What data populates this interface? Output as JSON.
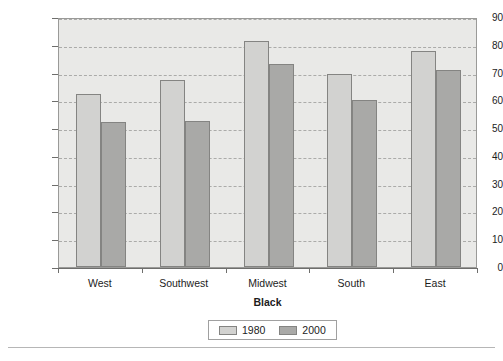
{
  "chart_data": {
    "type": "bar",
    "title": "",
    "subtitle": "",
    "xlabel": "Black",
    "ylabel": "Average Regional Dissimilarity Index",
    "categories": [
      "West",
      "Southwest",
      "Midwest",
      "South",
      "East"
    ],
    "series": [
      {
        "name": "1980",
        "color": "#d2d2d0",
        "values": [
          62.3,
          67.5,
          81.5,
          69.6,
          77.6
        ]
      },
      {
        "name": "2000",
        "color": "#a9a9a7",
        "values": [
          52.3,
          52.6,
          73.2,
          60.0,
          71.1
        ]
      }
    ],
    "ylim": [
      0,
      90
    ],
    "ytick_step": 10,
    "yticks": [
      "90",
      "80",
      "70",
      "60",
      "50",
      "40",
      "30",
      "20",
      "10",
      "0"
    ],
    "grid": true,
    "grid_axis": "y",
    "grid_style": "dashed",
    "legend": {
      "position": "bottom-center",
      "entries": [
        "1980",
        "2000"
      ]
    },
    "plot_background": "#e9e9e7"
  }
}
